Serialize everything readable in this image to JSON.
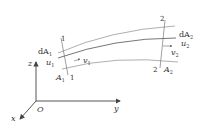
{
  "diagram": {
    "type": "stream tube with sections 1 and 2",
    "axes": {
      "x_label": "x",
      "y_label": "y",
      "z_label": "z",
      "origin_label": "O"
    },
    "section1": {
      "top_label": "1",
      "bottom_label": "1",
      "dA_label": "dA",
      "dA_sub": "1",
      "u_label": "u",
      "u_sub": "1",
      "v_label": "v",
      "v_sub": "1",
      "A_label": "A",
      "A_sub": "1"
    },
    "section2": {
      "top_label": "2",
      "bottom_label": "2",
      "dA_label": "dA",
      "dA_sub": "2",
      "u_label": "u",
      "u_sub": "2",
      "v_label": "v",
      "v_sub": "2",
      "A_label": "A",
      "A_sub": "2"
    },
    "colors": {
      "line": "#555555",
      "tube": "#9a9a9a",
      "text": "#333333"
    }
  }
}
